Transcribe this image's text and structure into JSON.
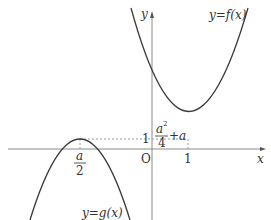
{
  "diagram": {
    "title": "",
    "axes": {
      "x_label": "x",
      "y_label": "y",
      "origin_label": "O"
    },
    "curves": [
      {
        "name": "f",
        "label": "y=f(x)",
        "shape": "upward parabola",
        "vertex": [
          "1",
          "1"
        ]
      },
      {
        "name": "g",
        "label": "y=g(x)",
        "shape": "downward parabola",
        "vertex": [
          "a/2",
          "a²/4+a"
        ]
      }
    ],
    "tick_labels": {
      "x_one": "1",
      "y_one": "1",
      "a_half_num": "a",
      "a_half_den": "2",
      "g_max_num": "a",
      "g_max_sup": "2",
      "g_max_den": "4",
      "g_max_tail": "+a"
    },
    "colors": {
      "curve": "#3a3a3a",
      "axis": "#8a8a8a",
      "dashed": "#9a9a9a",
      "text": "#333333"
    }
  }
}
